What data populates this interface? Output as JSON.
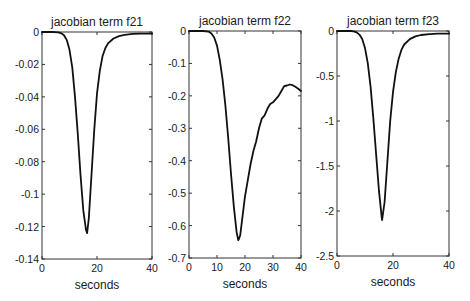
{
  "chart_data": [
    {
      "type": "line",
      "title": "jacobian term f21",
      "xlabel": "seconds",
      "ylabel": "",
      "xlim": [
        0,
        40
      ],
      "ylim": [
        -0.14,
        0
      ],
      "xticks": [
        0,
        20,
        40
      ],
      "xtick_labels": [
        "0",
        "20",
        "40"
      ],
      "yticks": [
        0,
        -0.02,
        -0.04,
        -0.06,
        -0.08,
        -0.1,
        -0.12,
        -0.14
      ],
      "ytick_labels": [
        "0",
        "-0.02",
        "-0.04",
        "-0.06",
        "-0.08",
        "-0.1",
        "-0.12",
        "-0.14"
      ],
      "grid": false,
      "box": [
        42,
        32,
        152,
        259
      ],
      "series": [
        {
          "name": "f21",
          "x": [
            0,
            4,
            6,
            7,
            8,
            9,
            10,
            11,
            12,
            13,
            14,
            15,
            16,
            16.4,
            17,
            18,
            19,
            20,
            21,
            22,
            23,
            24,
            26,
            28,
            30,
            33,
            36,
            40
          ],
          "y": [
            0,
            0,
            -0.0002,
            -0.0008,
            -0.002,
            -0.005,
            -0.011,
            -0.022,
            -0.04,
            -0.063,
            -0.088,
            -0.11,
            -0.122,
            -0.124,
            -0.115,
            -0.088,
            -0.06,
            -0.038,
            -0.024,
            -0.015,
            -0.01,
            -0.007,
            -0.004,
            -0.0025,
            -0.0017,
            -0.0012,
            -0.001,
            -0.001
          ]
        }
      ]
    },
    {
      "type": "line",
      "title": "jacobian term f22",
      "xlabel": "seconds",
      "ylabel": "",
      "xlim": [
        0,
        40
      ],
      "ylim": [
        -0.7,
        0
      ],
      "xticks": [
        0,
        10,
        20,
        30,
        40
      ],
      "xtick_labels": [
        "0",
        "10",
        "20",
        "30",
        "40"
      ],
      "yticks": [
        0,
        -0.1,
        -0.2,
        -0.3,
        -0.4,
        -0.5,
        -0.6,
        -0.7
      ],
      "ytick_labels": [
        "0",
        "-0.1",
        "-0.2",
        "-0.3",
        "-0.4",
        "-0.5",
        "-0.6",
        "-0.7"
      ],
      "grid": false,
      "box": [
        189,
        31,
        301,
        258
      ],
      "series": [
        {
          "name": "f22",
          "x": [
            0,
            5,
            7,
            8,
            9,
            10,
            11,
            12,
            13,
            14,
            15,
            16,
            17,
            17.6,
            17.9,
            18.3,
            19,
            20,
            21,
            22,
            23,
            24,
            25,
            26,
            27,
            28,
            29,
            30,
            31,
            32,
            33,
            34,
            35,
            36,
            37,
            38,
            39,
            40
          ],
          "y": [
            0,
            0,
            -0.002,
            -0.008,
            -0.02,
            -0.045,
            -0.09,
            -0.15,
            -0.23,
            -0.33,
            -0.44,
            -0.54,
            -0.62,
            -0.645,
            -0.64,
            -0.63,
            -0.58,
            -0.51,
            -0.46,
            -0.41,
            -0.37,
            -0.34,
            -0.3,
            -0.27,
            -0.26,
            -0.24,
            -0.225,
            -0.22,
            -0.21,
            -0.2,
            -0.185,
            -0.17,
            -0.168,
            -0.165,
            -0.167,
            -0.172,
            -0.178,
            -0.185
          ]
        }
      ]
    },
    {
      "type": "line",
      "title": "jacobian term f23",
      "xlabel": "seconds",
      "ylabel": "",
      "xlim": [
        0,
        40
      ],
      "ylim": [
        -2.5,
        0
      ],
      "xticks": [
        0,
        20,
        40
      ],
      "xtick_labels": [
        "0",
        "20",
        "40"
      ],
      "yticks": [
        0,
        -0.5,
        -1,
        -1.5,
        -2,
        -2.5
      ],
      "ytick_labels": [
        "0",
        "-0.5",
        "-1",
        "-1.5",
        "-2",
        "-2.5"
      ],
      "grid": false,
      "box": [
        337,
        31,
        449,
        256
      ],
      "series": [
        {
          "name": "f23",
          "x": [
            0,
            5,
            6,
            7,
            8,
            9,
            10,
            11,
            12,
            13,
            14,
            15,
            16,
            16.1,
            17,
            18,
            19,
            20,
            21,
            22,
            23,
            24,
            26,
            28,
            30,
            33,
            36,
            40
          ],
          "y": [
            0,
            0,
            -0.005,
            -0.015,
            -0.04,
            -0.09,
            -0.19,
            -0.36,
            -0.62,
            -0.98,
            -1.38,
            -1.78,
            -2.08,
            -2.1,
            -1.9,
            -1.45,
            -1.0,
            -0.68,
            -0.46,
            -0.31,
            -0.21,
            -0.15,
            -0.09,
            -0.06,
            -0.045,
            -0.035,
            -0.03,
            -0.03
          ]
        }
      ]
    }
  ]
}
